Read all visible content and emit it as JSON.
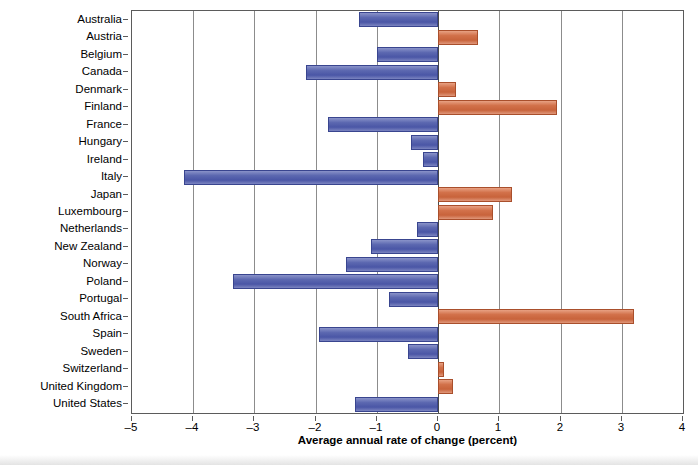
{
  "chart_data": {
    "type": "bar",
    "orientation": "horizontal",
    "title": "",
    "xlabel": "Average annual rate of change (percent)",
    "ylabel": "",
    "xlim": [
      -5,
      4
    ],
    "xticks": [
      -5,
      -4,
      -3,
      -2,
      -1,
      0,
      1,
      2,
      3,
      4
    ],
    "xtick_labels": [
      "–5",
      "–4",
      "–3",
      "–2",
      "–1",
      "0",
      "1",
      "2",
      "3",
      "4"
    ],
    "grid": true,
    "legend": "none",
    "categories": [
      "Australia",
      "Austria",
      "Belgium",
      "Canada",
      "Denmark",
      "Finland",
      "France",
      "Hungary",
      "Ireland",
      "Italy",
      "Japan",
      "Luxembourg",
      "Netherlands",
      "New Zealand",
      "Norway",
      "Poland",
      "Portugal",
      "South Africa",
      "Spain",
      "Sweden",
      "Switzerland",
      "United Kingdom",
      "United States"
    ],
    "values": [
      -1.3,
      0.65,
      -1.0,
      -2.15,
      0.3,
      1.95,
      -1.8,
      -0.45,
      -0.25,
      -4.15,
      1.2,
      0.9,
      -0.35,
      -1.1,
      -1.5,
      -3.35,
      -0.8,
      3.2,
      -1.95,
      -0.5,
      0.1,
      0.25,
      -1.35
    ],
    "colors": {
      "positive": "#cc6b3f",
      "negative": "#4f5bab",
      "axis": "#5b5b5b",
      "grid": "#8c8c8c",
      "background": "#ffffff"
    }
  }
}
